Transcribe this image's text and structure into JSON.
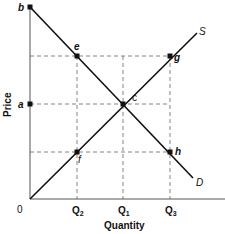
{
  "diagram": {
    "type": "supply-demand",
    "colors": {
      "line": "#111111",
      "dashed": "#777777",
      "background": "#ffffff"
    },
    "axes": {
      "x_label": "Quantity",
      "y_label": "Price",
      "origin_label": "0",
      "x_ticks": [
        {
          "label": "Q",
          "sub": "2",
          "x": 77
        },
        {
          "label": "Q",
          "sub": "1",
          "x": 123
        },
        {
          "label": "Q",
          "sub": "3",
          "x": 170
        }
      ],
      "y_ticks": [
        {
          "label": "a",
          "y": 104
        },
        {
          "label": "b",
          "y": 7
        }
      ]
    },
    "curves": [
      {
        "name": "Demand",
        "label": "D",
        "from": [
          30,
          7
        ],
        "to": [
          193,
          178
        ]
      },
      {
        "name": "Supply",
        "label": "S",
        "from": [
          30,
          199
        ],
        "to": [
          197,
          33
        ]
      }
    ],
    "points": [
      {
        "label": "b",
        "x": 30,
        "y": 7
      },
      {
        "label": "e",
        "x": 77,
        "y": 56
      },
      {
        "label": "g",
        "x": 170,
        "y": 56
      },
      {
        "label": "a",
        "x": 30,
        "y": 104
      },
      {
        "label": "c",
        "x": 123,
        "y": 104
      },
      {
        "label": "f",
        "x": 77,
        "y": 152
      },
      {
        "label": "h",
        "x": 170,
        "y": 152
      }
    ],
    "labels": {
      "b": "b",
      "e": "e",
      "g": "g",
      "a": "a",
      "c": "c",
      "f": "f",
      "h": "h",
      "S": "S",
      "D": "D",
      "origin": "0",
      "q2": "Q",
      "q2_sub": "2",
      "q1": "Q",
      "q1_sub": "1",
      "q3": "Q",
      "q3_sub": "3",
      "x_axis": "Quantity",
      "y_axis": "Price"
    }
  }
}
